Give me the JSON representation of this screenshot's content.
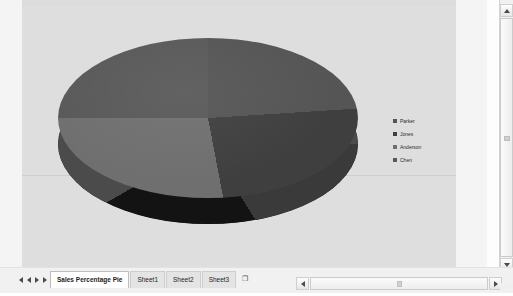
{
  "chart_data": {
    "type": "pie",
    "title": "",
    "three_d": true,
    "categories": [
      "Parker",
      "Jones",
      "Anderson",
      "Chen"
    ],
    "values": [
      24,
      23,
      28,
      25
    ],
    "legend_position": "right",
    "colors": [
      "#555555",
      "#3f3f3f",
      "#6f6f6f",
      "#595959"
    ]
  },
  "legend": {
    "items": [
      {
        "label": "Parker",
        "color": "#555555"
      },
      {
        "label": "Jones",
        "color": "#3f3f3f"
      },
      {
        "label": "Anderson",
        "color": "#6f6f6f"
      },
      {
        "label": "Chen",
        "color": "#595959"
      }
    ]
  },
  "sheet_tabs": {
    "nav": {
      "first": "|◀",
      "prev": "◀",
      "next": "▶",
      "last": "▶|"
    },
    "tabs": [
      {
        "label": "Sales Percentage Pie",
        "active": true
      },
      {
        "label": "Sheet1",
        "active": false
      },
      {
        "label": "Sheet2",
        "active": false
      },
      {
        "label": "Sheet3",
        "active": false
      }
    ],
    "new_sheet_label": "❐"
  },
  "scrollbars": {
    "vertical": {
      "up": "▲",
      "down": "▼"
    },
    "horizontal": {
      "left": "◀",
      "right": "▶"
    }
  }
}
